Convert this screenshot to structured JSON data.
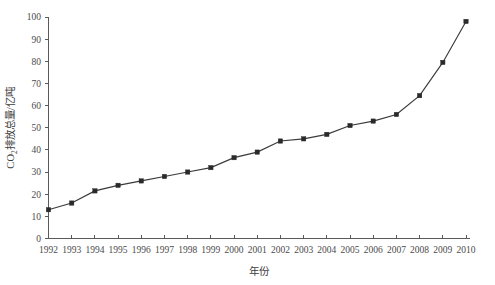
{
  "chart_data": {
    "type": "line",
    "title": "",
    "xlabel": "年份",
    "ylabel": "CO₂排放总量/亿吨",
    "ylabel_parts": {
      "prefix": "CO",
      "subscript": "2",
      "suffix": "排放总量/亿吨"
    },
    "categories": [
      "1992",
      "1993",
      "1994",
      "1995",
      "1996",
      "1997",
      "1998",
      "1999",
      "2000",
      "2001",
      "2002",
      "2003",
      "2004",
      "2005",
      "2006",
      "2007",
      "2008",
      "2009",
      "2010"
    ],
    "x": [
      1992,
      1993,
      1994,
      1995,
      1996,
      1997,
      1998,
      1999,
      2000,
      2001,
      2002,
      2003,
      2004,
      2005,
      2006,
      2007,
      2008,
      2009,
      2010
    ],
    "values": [
      13,
      16,
      21.5,
      24,
      26,
      28,
      30,
      32,
      36.5,
      39,
      44,
      45,
      47,
      51,
      53,
      56,
      64.5,
      79.5,
      98
    ],
    "ylim": [
      0,
      100
    ],
    "yticks": [
      0,
      10,
      20,
      30,
      40,
      50,
      60,
      70,
      80,
      90,
      100
    ],
    "ytick_labels": [
      "0",
      "10",
      "20",
      "30",
      "40",
      "50",
      "60",
      "70",
      "80",
      "90",
      "100"
    ],
    "xlim": [
      1992,
      2010
    ],
    "grid": false,
    "legend": null,
    "marker": "square",
    "line_color": "#3a3a3a",
    "marker_color": "#2a2a2a",
    "axis_color": "#5a5a5a",
    "background_color": "#ffffff"
  }
}
